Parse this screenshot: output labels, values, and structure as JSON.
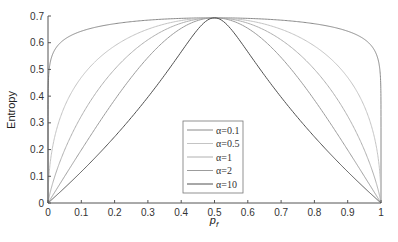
{
  "chart_data": {
    "type": "line",
    "title": "",
    "xlabel": "p_f",
    "ylabel": "Entropy",
    "xlim": [
      0,
      1
    ],
    "ylim": [
      0,
      0.7
    ],
    "x_ticks": [
      "0",
      "0.1",
      "0.2",
      "0.3",
      "0.4",
      "0.5",
      "0.6",
      "0.7",
      "0.8",
      "0.9",
      "1"
    ],
    "y_ticks": [
      "0",
      "0.1",
      "0.2",
      "0.3",
      "0.4",
      "0.5",
      "0.6",
      "0.7"
    ],
    "grid": false,
    "legend_position": "center-bottom",
    "x": [
      0,
      0.1,
      0.2,
      0.3,
      0.4,
      0.5,
      0.6,
      0.7,
      0.8,
      0.9,
      1
    ],
    "series": [
      {
        "name": "α=0.1",
        "alpha": 0.1,
        "color": "#8a8a8a",
        "values": [
          0,
          0.643,
          0.671,
          0.684,
          0.691,
          0.693,
          0.691,
          0.684,
          0.671,
          0.643,
          0
        ]
      },
      {
        "name": "α=0.5",
        "alpha": 0.5,
        "color": "#c4c4c4",
        "values": [
          0,
          0.47,
          0.588,
          0.651,
          0.683,
          0.693,
          0.683,
          0.651,
          0.588,
          0.47,
          0
        ]
      },
      {
        "name": "α=1",
        "alpha": 1,
        "color": "#b0b0b0",
        "values": [
          0,
          0.325,
          0.5,
          0.611,
          0.673,
          0.693,
          0.673,
          0.611,
          0.5,
          0.325,
          0
        ]
      },
      {
        "name": "α=2",
        "alpha": 2,
        "color": "#9c9c9c",
        "values": [
          0,
          0.198,
          0.386,
          0.545,
          0.654,
          0.693,
          0.654,
          0.545,
          0.386,
          0.198,
          0
        ]
      },
      {
        "name": "α=10",
        "alpha": 10,
        "color": "#505050",
        "values": [
          0,
          0.117,
          0.248,
          0.396,
          0.566,
          0.693,
          0.566,
          0.396,
          0.248,
          0.117,
          0
        ]
      }
    ]
  }
}
